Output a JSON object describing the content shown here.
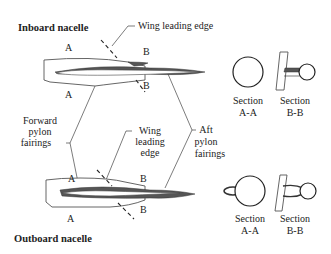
{
  "figure": {
    "inboard": {
      "title": "Inboard nacelle",
      "label_wing_leading_edge": "Wing leading edge",
      "section_marker_a_top": "A",
      "section_marker_a_bottom": "A",
      "section_marker_b_top": "B",
      "section_marker_b_bottom": "B",
      "section_aa_line1": "Section",
      "section_aa_line2": "A-A",
      "section_bb_line1": "Section",
      "section_bb_line2": "B-B"
    },
    "shared_labels": {
      "forward_pylon_line1": "Forward",
      "forward_pylon_line2": "pylon",
      "forward_pylon_line3": "fairings",
      "aft_pylon_line1": "Aft",
      "aft_pylon_line2": "pylon",
      "aft_pylon_line3": "fairings"
    },
    "outboard": {
      "title": "Outboard nacelle",
      "label_wing_line1": "Wing",
      "label_wing_line2": "leading",
      "label_wing_line3": "edge",
      "section_marker_a_top": "A",
      "section_marker_a_bottom": "A",
      "section_marker_b_top": "B",
      "section_marker_b_bottom": "B",
      "section_aa_line1": "Section",
      "section_aa_line2": "A-A",
      "section_bb_line1": "Section",
      "section_bb_line2": "B-B"
    }
  }
}
